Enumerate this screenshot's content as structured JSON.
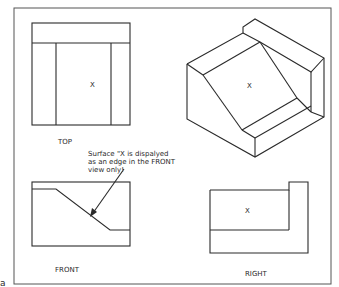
{
  "diagram": {
    "type": "orthographic-projection",
    "views": {
      "top": {
        "label": "TOP",
        "surface_mark": "X"
      },
      "isometric": {
        "surface_mark": "X"
      },
      "front": {
        "label": "FRONT"
      },
      "right": {
        "label": "RIGHT",
        "surface_mark": "X"
      }
    },
    "annotation": {
      "lines": [
        "Surface \"X is dispalyed",
        "as an edge in the FRONT",
        "view only!"
      ]
    },
    "corner_mark": "a"
  }
}
